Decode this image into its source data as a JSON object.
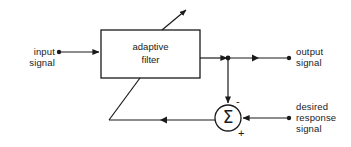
{
  "figure": {
    "kind": "block-diagram",
    "background_color": "#ffffff",
    "line_color": "#1a1a1a",
    "text_color": "#1a1a1a"
  },
  "block": {
    "name": "adaptive-filter-block",
    "line1": "adaptive",
    "line2": "filter",
    "x": 101,
    "y": 30,
    "width": 99,
    "height": 48
  },
  "summer": {
    "name": "summing-junction",
    "glyph": "Σ",
    "cx": 228,
    "cy": 118,
    "r": 13,
    "minus_sign": "-",
    "plus_sign": "+"
  },
  "labels": {
    "input": {
      "line1": "input",
      "line2": "signal"
    },
    "output": {
      "line1": "output",
      "line2": "signal"
    },
    "desired": {
      "line1": "desired",
      "line2": "response",
      "line3": "signal"
    }
  },
  "nodes": {
    "input_terminal_dot": {
      "x": 59,
      "y": 52
    },
    "output_tap_dot": {
      "x": 228,
      "y": 58
    },
    "output_terminal_dot": {
      "x": 289,
      "y": 52
    },
    "desired_terminal_dot": {
      "x": 289,
      "y": 118
    }
  },
  "connections": [
    {
      "name": "input-to-filter",
      "from": "input signal terminal",
      "to": "adaptive filter input",
      "arrow": true
    },
    {
      "name": "filter-to-tap",
      "from": "adaptive filter output",
      "to": "output tap node",
      "arrow": true
    },
    {
      "name": "tap-to-output",
      "from": "output tap node",
      "to": "output signal terminal",
      "arrow": true
    },
    {
      "name": "tap-to-summer",
      "from": "output tap node",
      "to": "summing junction negative input",
      "arrow": true
    },
    {
      "name": "desired-to-summer",
      "from": "desired response signal terminal",
      "to": "summing junction positive input",
      "arrow": true
    },
    {
      "name": "summer-to-feedback",
      "from": "summing junction output",
      "to": "error feedback bus",
      "arrow": true
    },
    {
      "name": "feedback-to-filter",
      "from": "error feedback bus",
      "to": "adaptive filter adaptation port",
      "arrow": false
    },
    {
      "name": "filter-adaptation-arrow",
      "from": "adaptive filter top",
      "to": "adaptation indicator",
      "arrow": true
    }
  ]
}
